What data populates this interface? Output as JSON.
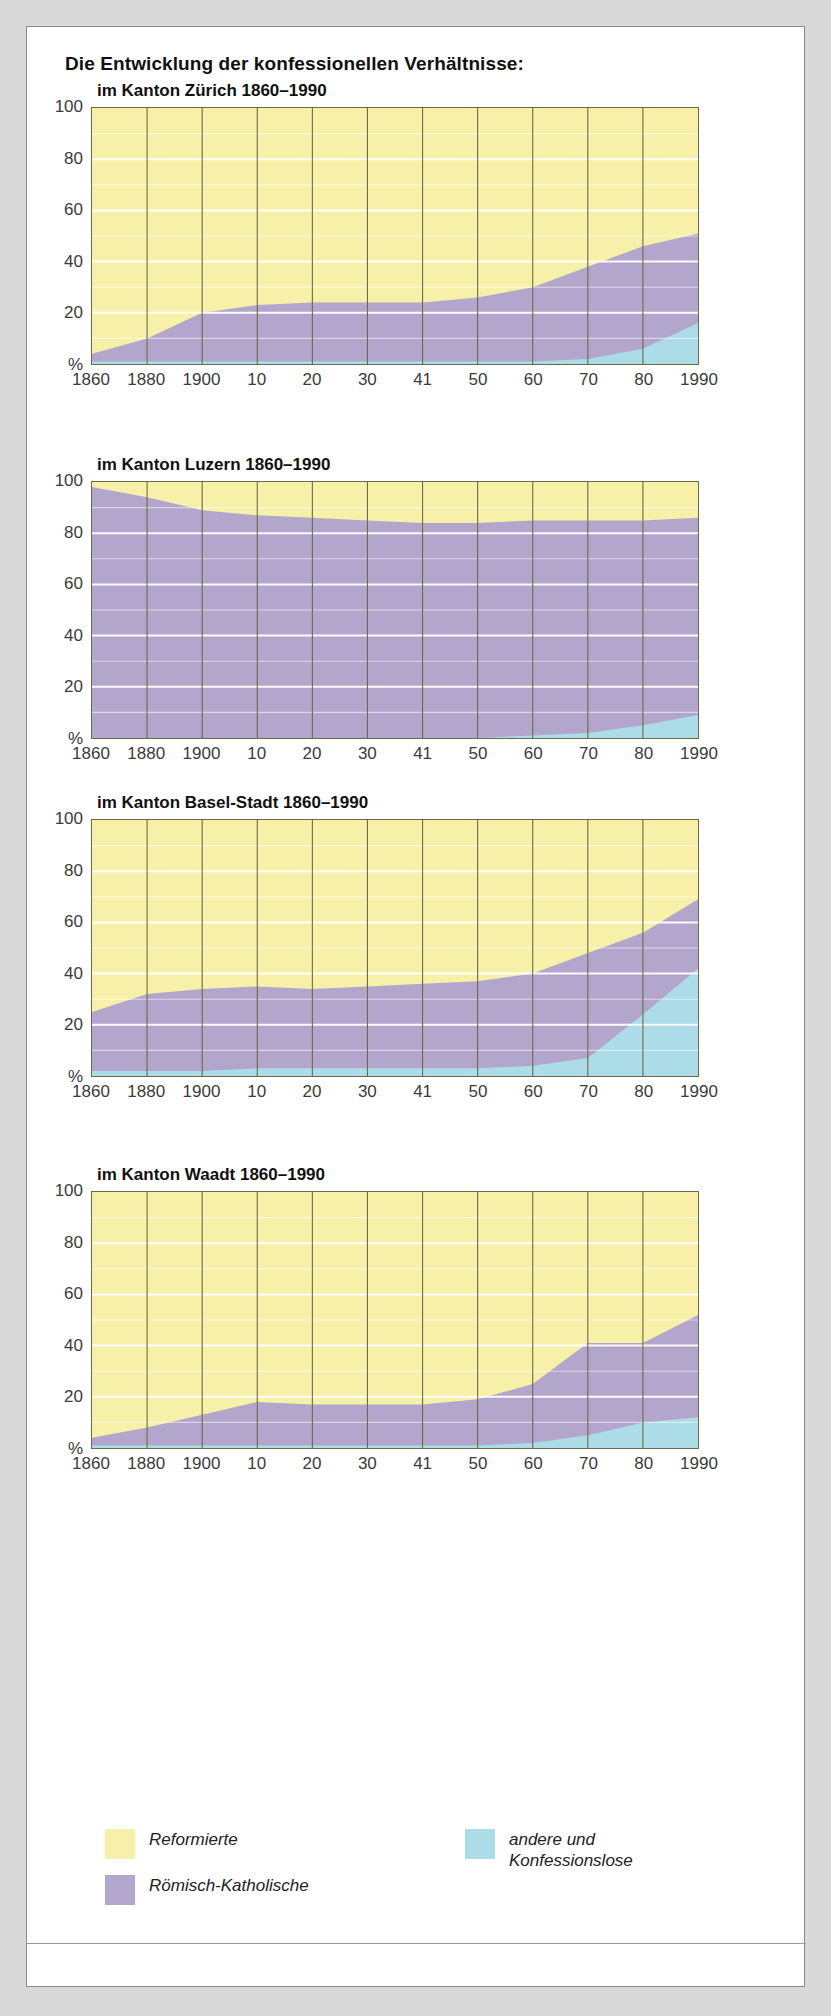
{
  "header": {
    "title": "Die Entwicklung der konfessionellen Verhältnisse:"
  },
  "axis": {
    "y_ticks": [
      "100",
      "80",
      "60",
      "40",
      "20",
      "%"
    ],
    "x_ticks": [
      "1860",
      "1880",
      "1900",
      "10",
      "20",
      "30",
      "41",
      "50",
      "60",
      "70",
      "80",
      "1990"
    ]
  },
  "colors": {
    "reformierte": "#f7f0a8",
    "katholische": "#b3a6cd",
    "andere": "#abdce7",
    "frame": "#6d6a46",
    "gridline": "#ffffff",
    "text": "#3b3b3b"
  },
  "legend": {
    "items": [
      {
        "label": "Reformierte",
        "color": "#f7f0a8",
        "name": "legend-reformierte"
      },
      {
        "label": "Römisch-Katholische",
        "color": "#b3a6cd",
        "name": "legend-katholische"
      },
      {
        "label": "andere und\nKonfessionslose",
        "label_line1": "andere und",
        "label_line2": "Konfessionslose",
        "color": "#abdce7",
        "name": "legend-andere"
      }
    ]
  },
  "chart_data": [
    {
      "type": "area",
      "id": "zuerich",
      "title": "im Kanton Zürich 1860–1990",
      "xlabel": "",
      "ylabel": "%",
      "ylim": [
        0,
        100
      ],
      "grid": true,
      "legend_position": "bottom",
      "categories": [
        "1860",
        "1880",
        "1900",
        "10",
        "20",
        "30",
        "41",
        "50",
        "60",
        "70",
        "80",
        "1990"
      ],
      "x": [
        1860,
        1880,
        1900,
        1910,
        1920,
        1930,
        1941,
        1950,
        1960,
        1970,
        1980,
        1990
      ],
      "series": [
        {
          "name": "andere und Konfessionslose",
          "values": [
            1,
            1,
            1,
            1,
            1,
            1,
            1,
            1,
            1,
            2,
            6,
            16
          ]
        },
        {
          "name": "Römisch-Katholische",
          "values": [
            3,
            9,
            19,
            22,
            23,
            23,
            23,
            25,
            29,
            36,
            40,
            35
          ]
        },
        {
          "name": "Reformierte",
          "values": [
            96,
            90,
            80,
            77,
            76,
            76,
            76,
            74,
            70,
            62,
            54,
            49
          ]
        }
      ]
    },
    {
      "type": "area",
      "id": "luzern",
      "title": "im Kanton Luzern 1860–1990",
      "xlabel": "",
      "ylabel": "%",
      "ylim": [
        0,
        100
      ],
      "grid": true,
      "legend_position": "bottom",
      "categories": [
        "1860",
        "1880",
        "1900",
        "10",
        "20",
        "30",
        "41",
        "50",
        "60",
        "70",
        "80",
        "1990"
      ],
      "x": [
        1860,
        1880,
        1900,
        1910,
        1920,
        1930,
        1941,
        1950,
        1960,
        1970,
        1980,
        1990
      ],
      "series": [
        {
          "name": "andere und Konfessionslose",
          "values": [
            0,
            0,
            0,
            0,
            0,
            0,
            0,
            0,
            1,
            2,
            5,
            9
          ]
        },
        {
          "name": "Römisch-Katholische",
          "values": [
            98,
            94,
            89,
            87,
            86,
            85,
            84,
            84,
            84,
            83,
            80,
            77
          ]
        },
        {
          "name": "Reformierte",
          "values": [
            2,
            6,
            11,
            13,
            14,
            15,
            16,
            16,
            15,
            15,
            15,
            14
          ]
        }
      ]
    },
    {
      "type": "area",
      "id": "basel-stadt",
      "title": "im Kanton Basel-Stadt 1860–1990",
      "xlabel": "",
      "ylabel": "%",
      "ylim": [
        0,
        100
      ],
      "grid": true,
      "legend_position": "bottom",
      "categories": [
        "1860",
        "1880",
        "1900",
        "10",
        "20",
        "30",
        "41",
        "50",
        "60",
        "70",
        "80",
        "1990"
      ],
      "x": [
        1860,
        1880,
        1900,
        1910,
        1920,
        1930,
        1941,
        1950,
        1960,
        1970,
        1980,
        1990
      ],
      "series": [
        {
          "name": "andere und Konfessionslose",
          "values": [
            2,
            2,
            2,
            3,
            3,
            3,
            3,
            3,
            4,
            7,
            24,
            42
          ]
        },
        {
          "name": "Römisch-Katholische",
          "values": [
            23,
            30,
            32,
            32,
            31,
            32,
            33,
            34,
            36,
            41,
            32,
            27
          ]
        },
        {
          "name": "Reformierte",
          "values": [
            75,
            68,
            66,
            65,
            66,
            65,
            64,
            63,
            60,
            52,
            44,
            31
          ]
        }
      ]
    },
    {
      "type": "area",
      "id": "waadt",
      "title": "im Kanton Waadt 1860–1990",
      "xlabel": "",
      "ylabel": "%",
      "ylim": [
        0,
        100
      ],
      "grid": true,
      "legend_position": "bottom",
      "categories": [
        "1860",
        "1880",
        "1900",
        "10",
        "20",
        "30",
        "41",
        "50",
        "60",
        "70",
        "80",
        "1990"
      ],
      "x": [
        1860,
        1880,
        1900,
        1910,
        1920,
        1930,
        1941,
        1950,
        1960,
        1970,
        1980,
        1990
      ],
      "series": [
        {
          "name": "andere und Konfessionslose",
          "values": [
            1,
            1,
            1,
            1,
            1,
            1,
            1,
            1,
            2,
            5,
            10,
            12
          ]
        },
        {
          "name": "Römisch-Katholische",
          "values": [
            3,
            7,
            12,
            17,
            16,
            16,
            16,
            18,
            23,
            36,
            31,
            40
          ]
        },
        {
          "name": "Reformierte",
          "values": [
            96,
            92,
            87,
            82,
            83,
            83,
            83,
            81,
            75,
            59,
            59,
            48
          ]
        }
      ]
    }
  ]
}
